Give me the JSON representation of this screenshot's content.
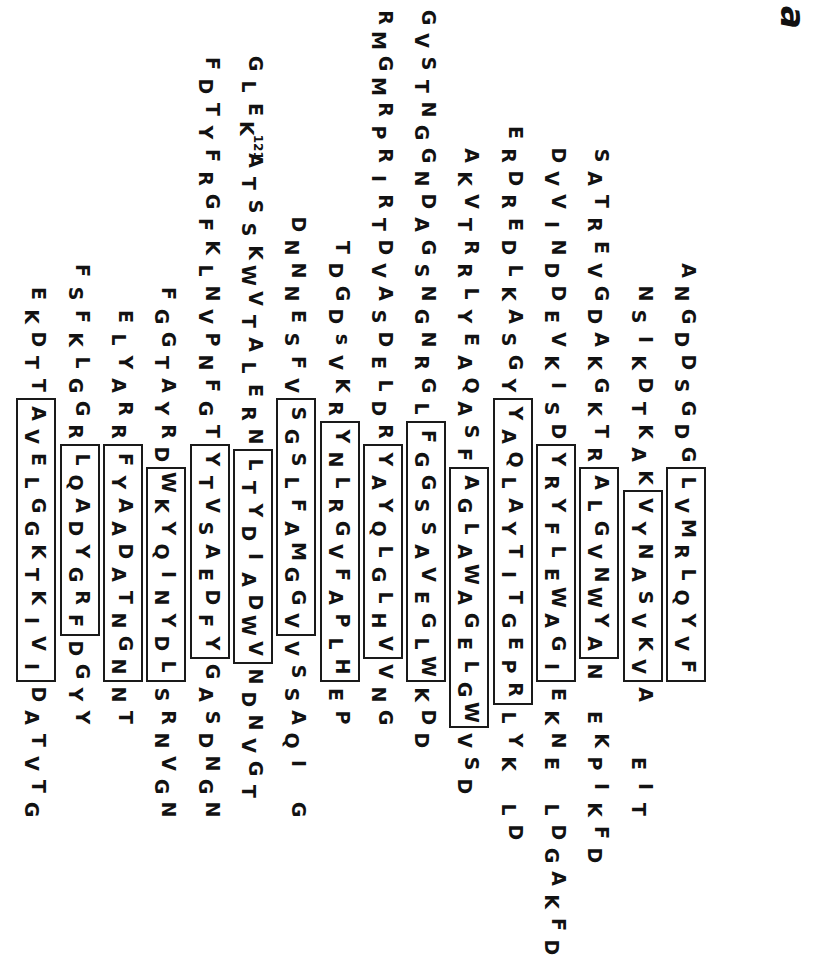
{
  "figure": {
    "panel_label": "a",
    "type": "protein-sequence-alignment",
    "orientation": "rotated-90-ccw",
    "residue_numbering": [
      {
        "label": "121",
        "residue": "K",
        "row": 10,
        "index": 3
      }
    ],
    "rows": [
      {
        "id": "row-1",
        "offset": 259,
        "segments": [
          {
            "type": "plain",
            "text": "ANGDDSGDG"
          },
          {
            "type": "boxed",
            "text": "LVMRLQYVF"
          }
        ]
      },
      {
        "id": "row-2",
        "offset": 282,
        "segments": [
          {
            "type": "plain",
            "text": "NSIKDTKAK"
          },
          {
            "type": "boxed",
            "text": "VYNASVKV"
          },
          {
            "type": "plain",
            "text": "A"
          },
          {
            "type": "gap",
            "text": "  "
          },
          {
            "type": "plain",
            "text": "EIT"
          }
        ]
      },
      {
        "id": "row-3",
        "offset": 144,
        "segments": [
          {
            "type": "plain",
            "text": "SATREVGDAKGKTR"
          },
          {
            "type": "boxed",
            "text": "ALGVNWYA"
          },
          {
            "type": "plain",
            "text": "N"
          },
          {
            "type": "gap",
            "text": " "
          },
          {
            "type": "plain",
            "text": "EKPIKFD"
          }
        ]
      },
      {
        "id": "row-4",
        "offset": 144,
        "segments": [
          {
            "type": "plain",
            "text": "DVVINDDEVKISD"
          },
          {
            "type": "boxed",
            "text": "YRYFLEWAGI"
          },
          {
            "type": "plain",
            "text": "EKNE"
          },
          {
            "type": "gap",
            "text": " "
          },
          {
            "type": "plain",
            "text": "LDGAKFD"
          }
        ]
      },
      {
        "id": "row-5",
        "offset": 121,
        "segments": [
          {
            "type": "plain",
            "text": "ERDREDLKASGY"
          },
          {
            "type": "boxed",
            "text": "YAQLAYTITGEPR"
          },
          {
            "type": "plain",
            "text": "LYK"
          },
          {
            "type": "gap",
            "text": " "
          },
          {
            "type": "plain",
            "text": "LD"
          }
        ]
      },
      {
        "id": "row-6",
        "offset": 144,
        "segments": [
          {
            "type": "plain",
            "text": "AKVTRRLYEAQASF"
          },
          {
            "type": "boxed",
            "text": "AGLAWAGELGW"
          },
          {
            "type": "plain",
            "text": "VSD"
          }
        ]
      },
      {
        "id": "row-7",
        "offset": 6,
        "segments": [
          {
            "type": "plain",
            "text": "GVSTNGGNDAGSNGNRGL"
          },
          {
            "type": "boxed",
            "text": "FGGSSAVEGLW"
          },
          {
            "type": "plain",
            "text": "KDD"
          }
        ]
      },
      {
        "id": "row-8",
        "offset": 6,
        "segments": [
          {
            "type": "plain",
            "text": "RMGMRPRIRTDVASDELDR"
          },
          {
            "type": "boxed",
            "text": "YAYQLGLHV"
          },
          {
            "type": "plain",
            "text": "VNG"
          }
        ]
      },
      {
        "id": "row-9",
        "offset": 236,
        "segments": [
          {
            "type": "plain",
            "text": "TDGDsVKR"
          },
          {
            "type": "boxed",
            "text": "YNLRGVFAPLH"
          },
          {
            "type": "plain",
            "text": "EP"
          }
        ]
      },
      {
        "id": "row-10",
        "offset": 213,
        "segments": [
          {
            "type": "plain",
            "text": "DNNNESFV"
          },
          {
            "type": "boxed",
            "text": "SGSLFAMGGV"
          },
          {
            "type": "plain",
            "text": "VSSAQI"
          },
          {
            "type": "gap",
            "text": " "
          },
          {
            "type": "plain",
            "text": "G"
          }
        ]
      },
      {
        "id": "row-11",
        "offset": 52,
        "segments": [
          {
            "type": "plain",
            "text": "GLE"
          },
          {
            "type": "sup",
            "text": "K",
            "sup": "121"
          },
          {
            "type": "plain",
            "text": "ATSSKWVTALERN"
          },
          {
            "type": "boxed",
            "text": "LTYDIADWV"
          },
          {
            "type": "plain",
            "text": "NDNVGT"
          }
        ]
      },
      {
        "id": "row-12",
        "offset": 52,
        "segments": [
          {
            "type": "plain",
            "text": "FDTYFRGFKLNVPNFGT"
          },
          {
            "type": "boxed",
            "text": "YTVSAEDFY"
          },
          {
            "type": "plain",
            "text": "GASDNGN"
          }
        ]
      },
      {
        "id": "row-13",
        "offset": 282,
        "segments": [
          {
            "type": "plain",
            "text": "FGGTAYRD"
          },
          {
            "type": "boxed",
            "text": "WKYQINYDL"
          },
          {
            "type": "plain",
            "text": "SRNVGN"
          }
        ]
      },
      {
        "id": "row-14",
        "offset": 305,
        "segments": [
          {
            "type": "plain",
            "text": "ELYARR"
          },
          {
            "type": "boxed",
            "text": "FYAADATNGN"
          },
          {
            "type": "plain",
            "text": "NT"
          }
        ]
      },
      {
        "id": "row-15",
        "offset": 259,
        "segments": [
          {
            "type": "plain",
            "text": "FSFKLGGR"
          },
          {
            "type": "boxed",
            "text": "LQADYGRF"
          },
          {
            "type": "plain",
            "text": "DGYY"
          }
        ]
      },
      {
        "id": "row-16",
        "offset": 282,
        "segments": [
          {
            "type": "plain",
            "text": "EKDTT"
          },
          {
            "type": "boxed",
            "text": "AVELGGKTKIVI"
          },
          {
            "type": "plain",
            "text": "DATVTG"
          }
        ]
      }
    ]
  }
}
